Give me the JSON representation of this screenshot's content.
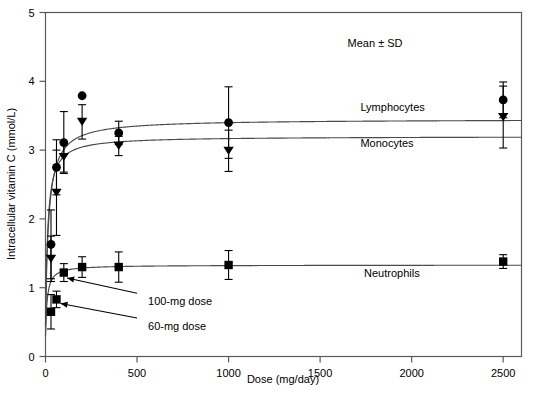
{
  "chart_data": {
    "type": "scatter",
    "title": "",
    "xlabel": "Dose (mg/day)",
    "ylabel": "Intracellular vitamin C (mmol/L)",
    "xlim": [
      0,
      2600
    ],
    "ylim": [
      0,
      5
    ],
    "xticks": [
      0,
      500,
      1000,
      1500,
      2000,
      2500
    ],
    "xticklabels": [
      "0",
      "500",
      "1000",
      "1500",
      "2000",
      "2500"
    ],
    "yticks": [
      0,
      1,
      2,
      3,
      4,
      5
    ],
    "yticklabels": [
      "0",
      "1",
      "2",
      "3",
      "4",
      "5"
    ],
    "grid": false,
    "legend_position": "inline-right",
    "error_bars": "SD",
    "annotations": [
      {
        "name": "mean-sd-note",
        "text": "Mean ± SD",
        "x": 1650,
        "y": 4.55
      },
      {
        "name": "lymphocytes-label",
        "text": "Lymphocytes",
        "x": 1720,
        "y": 3.63
      },
      {
        "name": "monocytes-label",
        "text": "Monocytes",
        "x": 1720,
        "y": 3.1
      },
      {
        "name": "neutrophils-label",
        "text": "Neutrophils",
        "x": 1740,
        "y": 1.22
      },
      {
        "name": "dose-100-annotation",
        "text": "100-mg dose",
        "x": 560,
        "y": 0.8
      },
      {
        "name": "dose-60-annotation",
        "text": "60-mg dose",
        "x": 560,
        "y": 0.45
      }
    ],
    "series": [
      {
        "name": "Lymphocytes",
        "marker": "circle",
        "x": [
          30,
          60,
          100,
          200,
          400,
          1000,
          2500
        ],
        "values": [
          1.63,
          2.75,
          3.11,
          3.79,
          3.25,
          3.4,
          3.73
        ],
        "sd": [
          0.5,
          0.4,
          0.45,
          0.0,
          0.17,
          0.52,
          0.26
        ]
      },
      {
        "name": "Monocytes",
        "marker": "triangle-down",
        "x": [
          30,
          60,
          100,
          200,
          400,
          1000,
          2500
        ],
        "values": [
          1.42,
          2.38,
          2.9,
          3.41,
          3.06,
          2.99,
          3.48
        ],
        "sd": [
          0.33,
          0.62,
          0.22,
          0.25,
          0.14,
          0.3,
          0.45
        ]
      },
      {
        "name": "Neutrophils",
        "marker": "square",
        "x": [
          30,
          60,
          100,
          200,
          400,
          1000,
          2500
        ],
        "values": [
          0.65,
          0.83,
          1.22,
          1.3,
          1.3,
          1.33,
          1.38
        ],
        "sd": [
          0.25,
          0.12,
          0.13,
          0.15,
          0.22,
          0.21,
          0.1
        ]
      }
    ],
    "fit_curves": [
      {
        "name": "Lymphocytes fit",
        "vmax": 3.45,
        "km": 18,
        "baseline": 0.55
      },
      {
        "name": "Monocytes fit",
        "vmax": 3.2,
        "km": 12,
        "baseline": 0.45
      },
      {
        "name": "Neutrophils fit",
        "vmax": 1.33,
        "km": 9,
        "baseline": 0.3
      }
    ]
  }
}
